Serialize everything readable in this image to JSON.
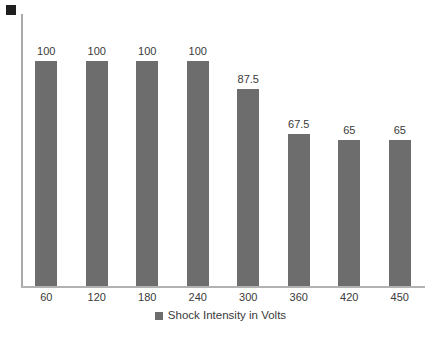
{
  "chart_data": {
    "type": "bar",
    "categories": [
      "60",
      "120",
      "180",
      "240",
      "300",
      "360",
      "420",
      "450"
    ],
    "values": [
      100,
      100,
      100,
      100,
      87.5,
      67.5,
      65,
      65
    ],
    "value_labels": [
      "100",
      "100",
      "100",
      "100",
      "87.5",
      "67.5",
      "65",
      "65"
    ],
    "title": "",
    "xlabel": "",
    "ylabel": "",
    "ylim": [
      0,
      120
    ],
    "grid": false,
    "legend_position": "bottom",
    "legend": [
      {
        "label": "Shock Intensity in Volts",
        "marker_color": "#6d6d6d"
      }
    ],
    "bar_color": "#6d6d6d",
    "axis_color": "#a9a9a9",
    "text_color": "#3a3a3a"
  }
}
